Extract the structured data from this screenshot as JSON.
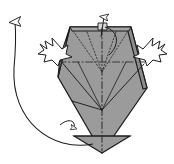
{
  "figure": {
    "kind": "origami-fold-step-diagram",
    "canvas": {
      "width": 174,
      "height": 164,
      "background": "#ffffff"
    },
    "labels": [],
    "annotations": []
  },
  "colors": {
    "paper_fill": "#9b9b9b",
    "paper_fill_shadow": "#8d8d8d",
    "paper_fill_highlight": "#a6a6a6",
    "outline": "#1c1c1c",
    "crease_valley": "#3a3a3a",
    "crease_hidden": "#2b2b2b",
    "arrow_stroke": "#1c1c1c",
    "arrow_fill": "#ffffff",
    "background": "#ffffff"
  },
  "model": {
    "name": "folded-paper-body",
    "description": "Shaded kite/diamond shaped folded paper seen from the front",
    "outline_points": "92,23 120,26 133,33 147,88 102,153 61,111 58,58 66,33",
    "top_edge": {
      "left": "70,27",
      "right": "131,27"
    },
    "bottom_apex": "102,153",
    "left_vertex": "58,76",
    "right_vertex": "147,88"
  },
  "creases": {
    "center_vertical": {
      "name": "center-vertical-axis",
      "style": "dash-dot",
      "from": "102,27",
      "to": "102,150"
    },
    "horizontal_mid": {
      "name": "horizontal-dash-dot-crease",
      "style": "dash-dot",
      "from": "59,62",
      "to": "146,62"
    },
    "hidden_v_left": {
      "name": "hidden-crease-left",
      "style": "dotted",
      "from": "72,30",
      "to": "102,70"
    },
    "hidden_v_right": {
      "name": "hidden-crease-right",
      "style": "dotted",
      "from": "129,30",
      "to": "102,70"
    },
    "hidden_inner_left": {
      "name": "hidden-inner-crease-left",
      "style": "dotted",
      "from": "86,31",
      "to": "102,70"
    },
    "hidden_inner_right": {
      "name": "hidden-inner-crease-right",
      "style": "dotted",
      "from": "117,31",
      "to": "102,70"
    },
    "fold_left": {
      "name": "visible-crease-left",
      "style": "solid",
      "from": "62,60",
      "to": "102,109"
    },
    "fold_right": {
      "name": "visible-crease-right",
      "style": "solid",
      "from": "143,62",
      "to": "102,109"
    },
    "fold_lower_left": {
      "name": "visible-crease-lower-left",
      "style": "solid",
      "from": "75,102",
      "to": "102,109"
    },
    "bottom_horizontal": {
      "name": "bottom-horizontal-crease",
      "style": "solid",
      "from": "74,136",
      "to": "130,136"
    }
  },
  "arrows": {
    "top_small": {
      "name": "top-unfold-arrow",
      "direction": "up",
      "meaning": "pull this flap upward",
      "path": "M 102,36 L 104,16",
      "head": "104,11"
    },
    "top_curl": {
      "name": "top-curl-arrow",
      "direction": "curl-down-right",
      "meaning": "fold layer over",
      "path": "M 104,28 C 118,30 120,44 110,54"
    },
    "big_left": {
      "name": "large-rotate-arrow",
      "direction": "counter-clockwise-up",
      "meaning": "swing the flap around to the top",
      "path": "M 92,143 C 50,150 10,120 14,66 16,44 16,36 15,24",
      "head": "15,14"
    },
    "starburst_left": {
      "name": "push-here-arrow-left",
      "direction": "push-right-down",
      "meaning": "push in at this point"
    },
    "starburst_right": {
      "name": "push-here-arrow-right",
      "direction": "push-left-down",
      "meaning": "push in at this point"
    },
    "bottom_small": {
      "name": "small-tuck-arrow",
      "direction": "curl",
      "meaning": "tuck the edge under"
    }
  }
}
